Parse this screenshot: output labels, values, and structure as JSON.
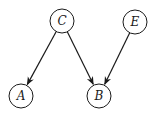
{
  "diagram": {
    "type": "directed-graph",
    "nodes": [
      {
        "id": "C",
        "label": "C",
        "cx": 62,
        "cy": 21,
        "r": 12
      },
      {
        "id": "E",
        "label": "E",
        "cx": 135,
        "cy": 22,
        "r": 12
      },
      {
        "id": "A",
        "label": "A",
        "cx": 21,
        "cy": 96,
        "r": 12
      },
      {
        "id": "B",
        "label": "B",
        "cx": 99,
        "cy": 96,
        "r": 12
      }
    ],
    "edges": [
      {
        "from": "C",
        "to": "A"
      },
      {
        "from": "C",
        "to": "B"
      },
      {
        "from": "E",
        "to": "B"
      }
    ],
    "colors": {
      "stroke": "#1a1a1a",
      "background": "#ffffff"
    }
  }
}
